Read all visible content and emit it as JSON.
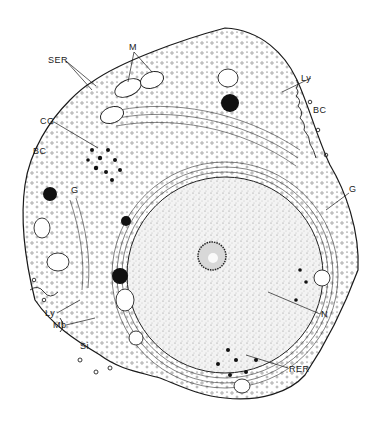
{
  "figure": {
    "colors": {
      "ink": "#1a1a1a",
      "background": "#ffffff",
      "nucleoplasm": "#efefef"
    },
    "labels": [
      {
        "id": "M",
        "text": "M",
        "x": 129,
        "y": 43,
        "target": "mitochondria"
      },
      {
        "id": "SER",
        "text": "SER",
        "x": 48,
        "y": 56,
        "target": "smooth endoplasmic reticulum"
      },
      {
        "id": "CG",
        "text": "CG",
        "x": 40,
        "y": 117,
        "target": "cytoplasmic granules"
      },
      {
        "id": "BC-left",
        "text": "BC",
        "x": 33,
        "y": 147,
        "target": "bile canaliculus"
      },
      {
        "id": "G-left",
        "text": "G",
        "x": 71,
        "y": 186,
        "target": "Golgi"
      },
      {
        "id": "Ly-top",
        "text": "Ly",
        "x": 301,
        "y": 74,
        "target": "lysosome"
      },
      {
        "id": "BC-right",
        "text": "BC",
        "x": 313,
        "y": 106,
        "target": "bile canaliculus"
      },
      {
        "id": "G-right",
        "text": "G",
        "x": 349,
        "y": 185,
        "target": "Golgi"
      },
      {
        "id": "Ly-bottom",
        "text": "Ly",
        "x": 45,
        "y": 309,
        "target": "lysosome"
      },
      {
        "id": "Mb",
        "text": "Mb",
        "x": 53,
        "y": 321,
        "target": "microbody"
      },
      {
        "id": "Si",
        "text": "Si",
        "x": 80,
        "y": 342,
        "target": "sinusoid"
      },
      {
        "id": "N",
        "text": "N",
        "x": 321,
        "y": 310,
        "target": "nucleus"
      },
      {
        "id": "RER",
        "text": "RER",
        "x": 289,
        "y": 365,
        "target": "rough endoplasmic reticulum"
      }
    ]
  }
}
